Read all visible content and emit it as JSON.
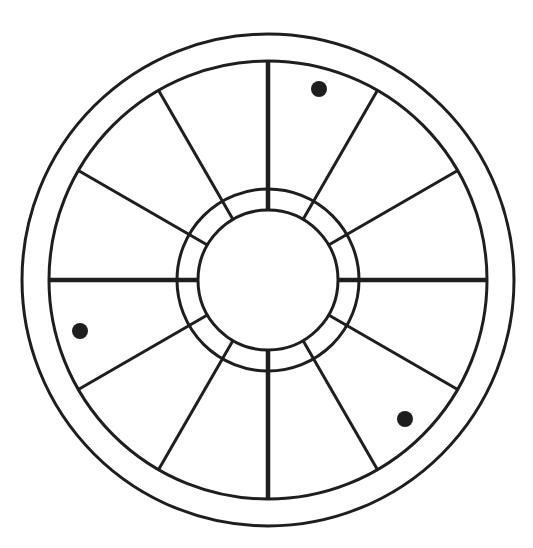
{
  "diagram": {
    "type": "twelve-house-wheel",
    "canvas": {
      "width": 533,
      "height": 548
    },
    "center": {
      "x": 268,
      "y": 280
    },
    "stroke_color": "#1e1e1e",
    "background": "#ffffff",
    "rings": [
      {
        "name": "outer-ring",
        "radius": 246,
        "stroke_width": 3
      },
      {
        "name": "house-ring",
        "radius": 219,
        "stroke_width": 3
      },
      {
        "name": "middle-ring",
        "radius": 91,
        "stroke_width": 3
      },
      {
        "name": "inner-ring",
        "radius": 70,
        "stroke_width": 3
      }
    ],
    "divisions": 12,
    "spokes": {
      "inner_radius": 70,
      "outer_radius": 219,
      "angle_step_deg": 30,
      "thick_width": 4.5,
      "thin_width": 3
    },
    "markers": [
      {
        "name": "marker-top-right",
        "x": 319,
        "y": 89,
        "radius": 8
      },
      {
        "name": "marker-left",
        "x": 80,
        "y": 331,
        "radius": 8
      },
      {
        "name": "marker-bottom-right",
        "x": 405,
        "y": 419,
        "radius": 8
      }
    ]
  }
}
